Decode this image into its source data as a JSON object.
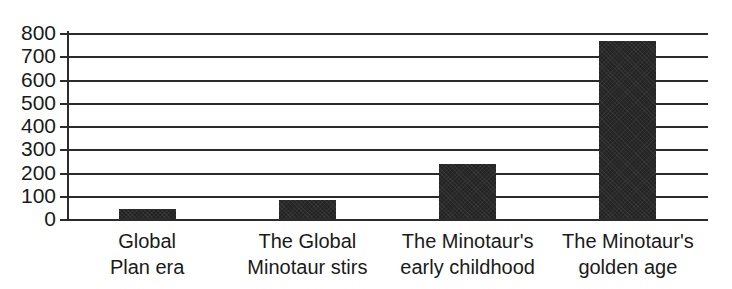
{
  "chart_data": {
    "type": "bar",
    "title": "",
    "subtitle": "",
    "xlabel": "",
    "ylabel": "",
    "categories": [
      "Global\nPlan era",
      "The Global\nMinotaur stirs",
      "The Minotaur's\nearly childhood",
      "The Minotaur's\ngolden age"
    ],
    "category_lines": [
      [
        "Global",
        "Plan era"
      ],
      [
        "The Global",
        "Minotaur stirs"
      ],
      [
        "The Minotaur's",
        "early childhood"
      ],
      [
        "The Minotaur's",
        "golden age"
      ]
    ],
    "values": [
      45,
      80,
      235,
      765
    ],
    "ylim": [
      0,
      800
    ],
    "yticks": [
      800,
      700,
      600,
      500,
      400,
      300,
      200,
      100,
      0
    ],
    "ytick_labels": [
      "800",
      "700",
      "600",
      "500",
      "400",
      "300",
      "200",
      "100",
      "0"
    ],
    "grid": true,
    "grid_axis": "y",
    "legend": false,
    "legend_position": "none",
    "bar_color": "#242424",
    "axis_color": "#2b2b2b",
    "text_color": "#1a1a1a",
    "background_color": "#ffffff"
  }
}
